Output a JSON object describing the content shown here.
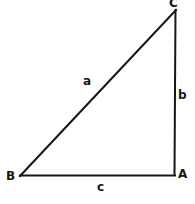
{
  "figure": {
    "name": "right-triangle-diagram",
    "background_color": "#ffffff",
    "stroke_color": "#161616",
    "stroke_width": 2,
    "width": 195,
    "height": 204
  },
  "vertices": {
    "a": {
      "label": "A",
      "x": 174,
      "y": 175
    },
    "b": {
      "label": "B",
      "x": 20,
      "y": 176
    },
    "c": {
      "label": "C",
      "x": 176,
      "y": 10
    }
  },
  "sides": {
    "a": {
      "label": "a",
      "from": "B",
      "to": "C",
      "role": "hypotenuse"
    },
    "b": {
      "label": "b",
      "from": "A",
      "to": "C",
      "role": "vertical-leg"
    },
    "c": {
      "label": "c",
      "from": "B",
      "to": "A",
      "role": "horizontal-base"
    }
  },
  "chart_data": {
    "type": "diagram",
    "title": "",
    "shape": "right triangle",
    "points": [
      {
        "name": "A",
        "x": 174,
        "y": 175
      },
      {
        "name": "B",
        "x": 20,
        "y": 176
      },
      {
        "name": "C",
        "x": 176,
        "y": 10
      }
    ],
    "edges": [
      {
        "label": "a",
        "endpoints": [
          "B",
          "C"
        ]
      },
      {
        "label": "b",
        "endpoints": [
          "A",
          "C"
        ]
      },
      {
        "label": "c",
        "endpoints": [
          "B",
          "A"
        ]
      }
    ],
    "annotations": [
      "A",
      "B",
      "C",
      "a",
      "b",
      "c"
    ]
  }
}
